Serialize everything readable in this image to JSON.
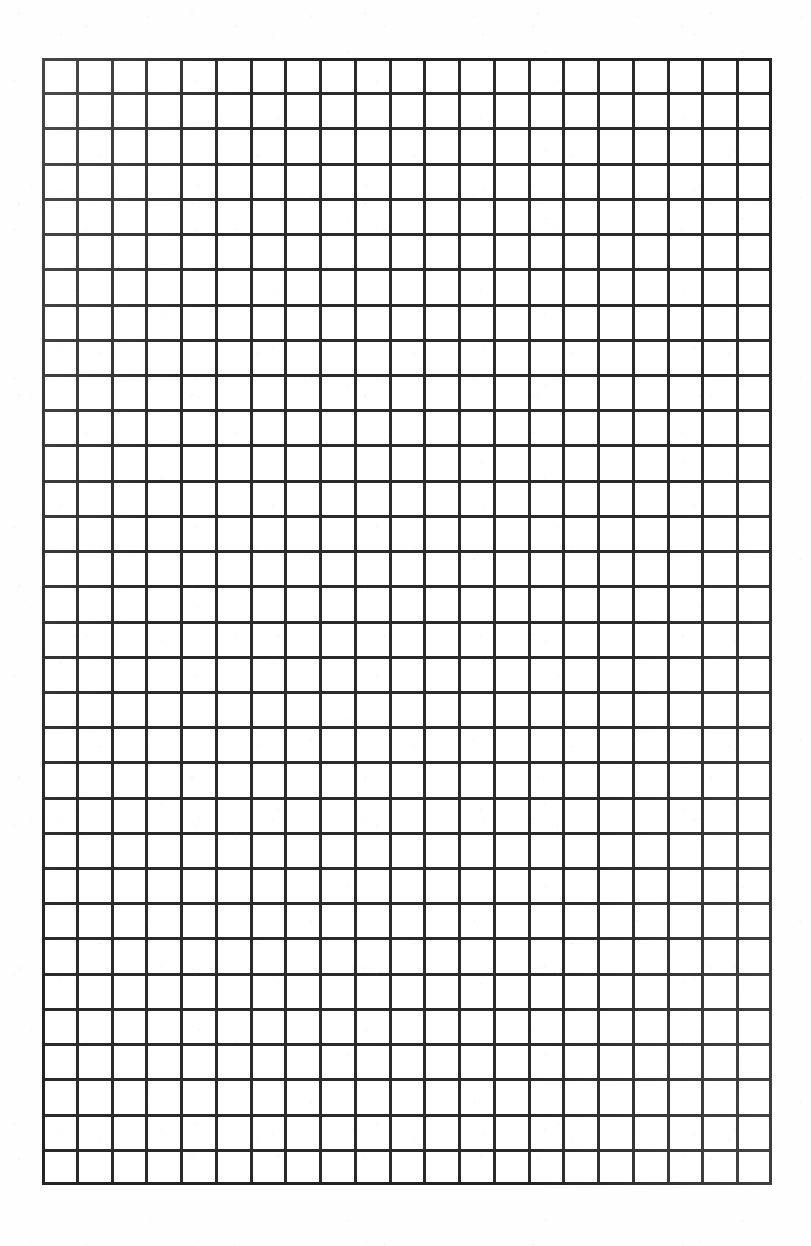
{
  "page": {
    "kind": "scanned-grid-paper",
    "width": 811,
    "height": 1246,
    "background_color": "#fefefe",
    "ink_color": "#2a2a2a"
  },
  "header": {
    "visible_text": "",
    "note_label": "cropped-header-line"
  },
  "grid": {
    "columns": 21,
    "rows": 32,
    "cell_width_px": 34.8,
    "cell_height_px": 35.2,
    "left_px": 42,
    "top_px": 58,
    "width_px": 730,
    "height_px": 1127,
    "line_color": "#2a2a2a",
    "line_width_px": 2.4,
    "border_color": "#232323",
    "border_width_px": 3.2,
    "cell_fill": "#ffffff",
    "contents": []
  },
  "chart_data": {
    "type": "table",
    "title": "",
    "xlabel": "",
    "ylabel": "",
    "columns": 21,
    "rows": 32,
    "grid": true,
    "legend": "none",
    "categories": [],
    "values": [],
    "note": "Blank quadrille / graph paper: 21 columns by 32 rows of empty cells, no plotted data."
  }
}
